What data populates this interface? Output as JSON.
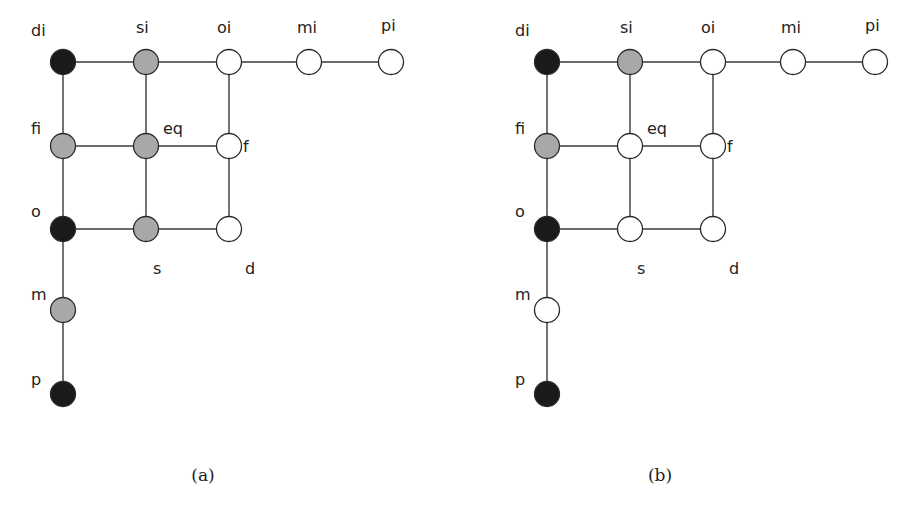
{
  "colors": {
    "black": "#1a1a1a",
    "gray": "#a8a8a8",
    "white": "#ffffff"
  },
  "nodes": [
    "di",
    "si",
    "oi",
    "mi",
    "pi",
    "fi",
    "eq",
    "f",
    "o",
    "s",
    "d",
    "m",
    "p"
  ],
  "edges": [
    [
      "di",
      "si"
    ],
    [
      "si",
      "oi"
    ],
    [
      "oi",
      "mi"
    ],
    [
      "mi",
      "pi"
    ],
    [
      "di",
      "fi"
    ],
    [
      "fi",
      "o"
    ],
    [
      "o",
      "m"
    ],
    [
      "m",
      "p"
    ],
    [
      "si",
      "eq"
    ],
    [
      "eq",
      "s"
    ],
    [
      "oi",
      "f"
    ],
    [
      "f",
      "d"
    ],
    [
      "fi",
      "eq"
    ],
    [
      "eq",
      "f"
    ],
    [
      "o",
      "s"
    ],
    [
      "s",
      "d"
    ]
  ],
  "panels": [
    {
      "caption": "(a)",
      "fills": {
        "di": "black",
        "si": "gray",
        "oi": "white",
        "mi": "white",
        "pi": "white",
        "fi": "gray",
        "eq": "gray",
        "f": "white",
        "o": "black",
        "s": "gray",
        "d": "white",
        "m": "gray",
        "p": "black"
      }
    },
    {
      "caption": "(b)",
      "fills": {
        "di": "black",
        "si": "gray",
        "oi": "white",
        "mi": "white",
        "pi": "white",
        "fi": "gray",
        "eq": "white",
        "f": "white",
        "o": "black",
        "s": "white",
        "d": "white",
        "m": "white",
        "p": "black"
      }
    }
  ]
}
